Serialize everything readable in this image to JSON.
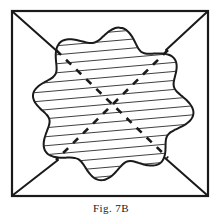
{
  "figure": {
    "caption": "Fig. 7B",
    "caption_label": "Fig.",
    "caption_number": "7B",
    "title": "Fig. 7B",
    "background_color": "#ffffff",
    "ink_color": "#1a1a1a",
    "frame": {
      "name": "outer-square-border",
      "x": 12,
      "y": 11,
      "width": 196,
      "height": 185,
      "stroke": "#1a1a1a",
      "stroke_width": 2.2,
      "fill": "none"
    },
    "corner_leaders": {
      "name": "corner-diagonal-leaders",
      "count": 4,
      "stroke": "#1a1a1a",
      "stroke_width": 2.0,
      "lines": [
        {
          "name": "leader-top-left",
          "x1": 13,
          "y1": 12,
          "x2": 58,
          "y2": 52
        },
        {
          "name": "leader-top-right",
          "x1": 207,
          "y1": 12,
          "x2": 166,
          "y2": 50
        },
        {
          "name": "leader-bottom-left",
          "x1": 13,
          "y1": 195,
          "x2": 58,
          "y2": 160
        },
        {
          "name": "leader-bottom-right",
          "x1": 207,
          "y1": 195,
          "x2": 165,
          "y2": 158
        }
      ]
    },
    "blob": {
      "name": "hatched-amoeboid-region",
      "stroke": "#1a1a1a",
      "stroke_width": 2.0,
      "fill": "#ffffff",
      "center_x": 111,
      "center_y": 104,
      "mean_radius": 72,
      "lobes": 8,
      "lobe_amplitude": 8
    },
    "hatching": {
      "name": "horizontal-hatch-fill",
      "stroke": "#2a2a2a",
      "stroke_width": 0.9,
      "spacing": 9,
      "angle_deg": -5,
      "line_count": 17
    },
    "dashed_diagonals": {
      "name": "dashed-cross-axes",
      "stroke": "#1a1a1a",
      "stroke_width": 2.6,
      "dash_pattern": "7 7",
      "lines": [
        {
          "name": "dashed-axis-nw-se",
          "x1": 56,
          "y1": 50,
          "x2": 168,
          "y2": 158
        },
        {
          "name": "dashed-axis-ne-sw",
          "x1": 168,
          "y1": 50,
          "x2": 56,
          "y2": 160
        }
      ]
    }
  }
}
